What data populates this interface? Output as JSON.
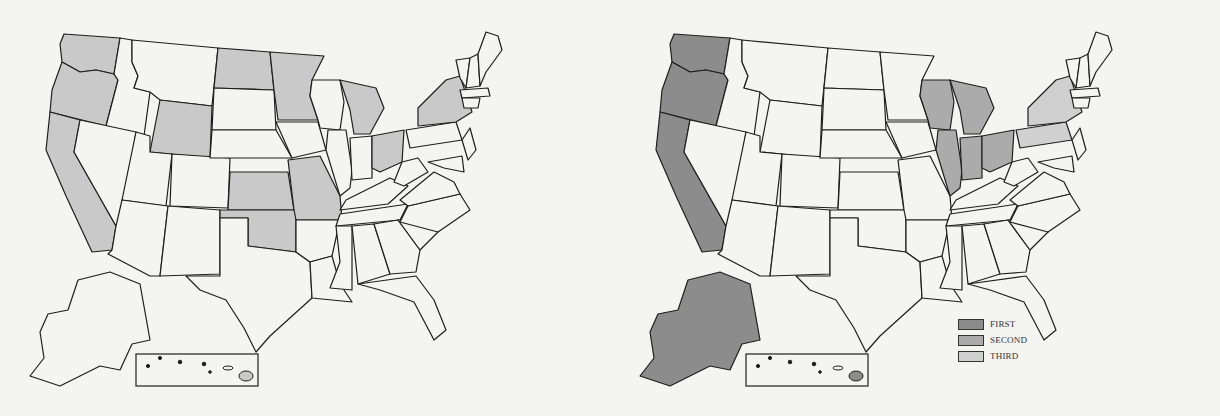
{
  "figure": {
    "left_map": {
      "title": "",
      "description": "Individual states, selected states shaded",
      "shade_color": "#c9c9c9",
      "unshaded_color": "#f4f4f2",
      "shaded_states": [
        "WA",
        "OR",
        "CA",
        "WY",
        "ND",
        "MN",
        "MI",
        "OH",
        "NY",
        "KS",
        "OK",
        "MO",
        "HI-big-island"
      ]
    },
    "right_map": {
      "title": "",
      "description": "Regional grouping",
      "legend": [
        {
          "label": "FIRST",
          "color": "#8c8c8c"
        },
        {
          "label": "SECOND",
          "color": "#ababab"
        },
        {
          "label": "THIRD",
          "color": "#d0d0d0"
        }
      ],
      "regions": {
        "FIRST": [
          "WA",
          "OR",
          "CA",
          "AK",
          "HI-big-island"
        ],
        "SECOND": [
          "WI",
          "MI",
          "IL",
          "IN",
          "OH"
        ],
        "THIRD": [
          "NY",
          "PA"
        ]
      }
    }
  }
}
